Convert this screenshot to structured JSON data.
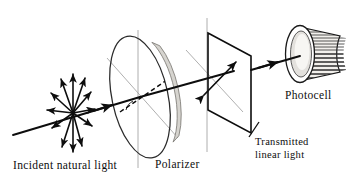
{
  "figure": {
    "background_color": "#ffffff",
    "ink_color": "#0d0d0d",
    "axis_line_color": "#9a9a9a",
    "shade_color": "#d6d4cf"
  },
  "labels": {
    "incident": "Incident natural light",
    "polarizer": "Polarizer",
    "transmitted_line1": "Transmitted",
    "transmitted_line2": "linear light",
    "photocell": "Photocell"
  },
  "components": {
    "unpolarized_source": {
      "name": "unpolarized-light-starburst",
      "center": [
        73,
        113
      ],
      "arrow_count": 12,
      "description": "double-headed arrows radiating in all transverse directions"
    },
    "polarizer_disk": {
      "name": "polarizer-disk",
      "center": [
        140,
        97
      ],
      "rx": 28,
      "ry": 62,
      "tilt_deg": -12,
      "rim_shade": "#d6d4cf",
      "transmission_axis": "dashed"
    },
    "transmitted_plane": {
      "name": "transmitted-plane",
      "corners": [
        [
          208,
          33
        ],
        [
          251,
          56
        ],
        [
          251,
          133
        ],
        [
          208,
          110
        ]
      ],
      "polarization_arrow": "double-headed, tilted about 45 degrees"
    },
    "photocell": {
      "name": "photocell-cylinder",
      "face_center": [
        300,
        54
      ],
      "face_rx": 13,
      "face_ry": 27,
      "body_length": 46,
      "rib_count": 20
    }
  },
  "beam_path": {
    "segments": [
      {
        "name": "incident-beam",
        "from": [
          13,
          135
        ],
        "to": [
          140,
          97
        ],
        "arrowheads": 1
      },
      {
        "name": "polarized-beam",
        "from": [
          140,
          97
        ],
        "to": [
          231,
          72
        ],
        "arrowheads": 1
      },
      {
        "name": "detector-beam",
        "from": [
          251,
          70
        ],
        "to": [
          302,
          55
        ],
        "arrowheads": 1
      }
    ]
  }
}
